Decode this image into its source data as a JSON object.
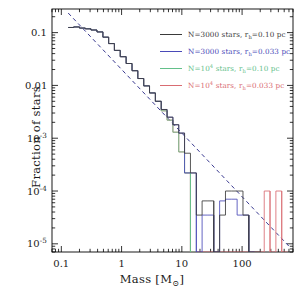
{
  "figure": {
    "background": "#ffffff",
    "frame_color": "#000000"
  },
  "axes": {
    "xlabel_prefix": "Mass [M",
    "xlabel_sub": "⊙",
    "xlabel_suffix": "]",
    "xlabel_full": "Mass [M⊙]",
    "ylabel": "Fraction of stars",
    "x_ticklabels": [
      "0.1",
      "1",
      "10",
      "100"
    ],
    "x_tickvalues": [
      0.1,
      1,
      10,
      100
    ],
    "y_ticklabels": [
      "0.1",
      "0.01",
      "10⁻³",
      "10⁻⁴",
      "10⁻⁵"
    ],
    "y_tickvalues": [
      0.1,
      0.01,
      0.001,
      0.0001,
      1e-05
    ],
    "xscale": "log",
    "yscale": "log",
    "xlim": [
      0.07,
      700
    ],
    "ylim": [
      7e-06,
      0.28
    ],
    "grid": false
  },
  "legend": {
    "position": "upper-right",
    "entries": [
      {
        "label": "N=3000 stars, r",
        "sub": "h",
        "label_tail": "=0.10 pc",
        "full": "N=3000 stars, r_h=0.10 pc",
        "color": "#3a3a3a"
      },
      {
        "label": "N=3000 stars, r",
        "sub": "h",
        "label_tail": "=0.033 pc",
        "full": "N=3000 stars, r_h=0.033 pc",
        "color": "#4a4ab8"
      },
      {
        "label_pre": "N=10",
        "sup": "4",
        "label_mid": " stars, r",
        "sub": "h",
        "label_tail": "=0.10 pc",
        "full": "N=10^4 stars, r_h=0.10 pc",
        "color": "#63c08a"
      },
      {
        "label_pre": "N=10",
        "sup": "4",
        "label_mid": " stars, r",
        "sub": "h",
        "label_tail": "=0.033 pc",
        "full": "N=10^4 stars, r_h=0.033 pc",
        "color": "#d96c72"
      }
    ]
  },
  "chart_data": {
    "type": "line",
    "title": "",
    "xlabel": "Mass [M⊙]",
    "ylabel": "Fraction of stars",
    "xscale": "log",
    "yscale": "log",
    "xlim": [
      0.07,
      700
    ],
    "ylim": [
      7e-06,
      0.28
    ],
    "grid": false,
    "annotations": [
      {
        "name": "salpeter-reference-line",
        "style": "dashed",
        "color": "#2f2f8a",
        "description": "power-law reference line",
        "x": [
          0.13,
          600
        ],
        "y": [
          0.235,
          9e-06
        ]
      }
    ],
    "series": [
      {
        "name": "N=3000 stars, r_h=0.10 pc",
        "color": "#3a3a3a",
        "drawstyle": "steps",
        "x": [
          0.13,
          0.16,
          0.2,
          0.25,
          0.31,
          0.39,
          0.49,
          0.61,
          0.76,
          0.95,
          1.19,
          1.49,
          1.86,
          2.33,
          2.91,
          3.64,
          4.55,
          5.69,
          7.11,
          8.89,
          11.1,
          13.9,
          17.4,
          21.7,
          27.1,
          33.9,
          42.4,
          53.0,
          66.2,
          82.8,
          103.5,
          129.4,
          161.7
        ],
        "y": [
          0.125,
          0.128,
          0.122,
          0.118,
          0.112,
          0.103,
          0.082,
          0.062,
          0.046,
          0.035,
          0.026,
          0.019,
          0.0135,
          0.0098,
          0.0072,
          0.005,
          0.0035,
          0.0025,
          0.0018,
          0.00125,
          0.00052,
          0.00022,
          3.5e-05,
          6.5e-05,
          6.5e-05,
          0.0,
          3.5e-05,
          0.0001,
          0.0001,
          0.0001,
          3.5e-05,
          0.0,
          0.0
        ]
      },
      {
        "name": "N=3000 stars, r_h=0.033 pc",
        "color": "#4a4ab8",
        "drawstyle": "steps",
        "x": [
          0.13,
          0.16,
          0.2,
          0.25,
          0.31,
          0.39,
          0.49,
          0.61,
          0.76,
          0.95,
          1.19,
          1.49,
          1.86,
          2.33,
          2.91,
          3.64,
          4.55,
          5.69,
          7.11,
          8.89,
          11.1,
          13.9,
          17.4,
          21.7,
          27.1,
          33.9,
          42.4,
          53.0,
          66.2,
          82.8,
          103.5,
          129.4
        ],
        "y": [
          0.125,
          0.128,
          0.122,
          0.118,
          0.112,
          0.103,
          0.082,
          0.062,
          0.046,
          0.035,
          0.026,
          0.019,
          0.0135,
          0.0098,
          0.0072,
          0.005,
          0.0035,
          0.0025,
          0.0018,
          0.00125,
          0.00022,
          0.00022,
          0.0,
          3.5e-05,
          3.5e-05,
          0.0,
          6.5e-05,
          7e-05,
          7e-05,
          3.5e-05,
          3.5e-05,
          0.0
        ]
      },
      {
        "name": "N=10^4 stars, r_h=0.10 pc",
        "color": "#63c08a",
        "drawstyle": "steps",
        "x": [
          0.13,
          0.16,
          0.2,
          0.25,
          0.31,
          0.39,
          0.49,
          0.61,
          0.76,
          0.95,
          1.19,
          1.49,
          1.86,
          2.33,
          2.91,
          3.64,
          4.55,
          5.69,
          7.11,
          8.89,
          11.1,
          13.9
        ],
        "y": [
          0.125,
          0.128,
          0.122,
          0.118,
          0.112,
          0.103,
          0.082,
          0.062,
          0.046,
          0.035,
          0.026,
          0.019,
          0.0135,
          0.0098,
          0.0072,
          0.005,
          0.0033,
          0.0022,
          0.0013,
          0.00055,
          0.00022,
          0.0
        ]
      },
      {
        "name": "N=10^4 stars, r_h=0.033 pc",
        "color": "#d96c72",
        "drawstyle": "steps",
        "x": [
          0.13,
          0.16,
          0.2,
          0.25,
          0.31,
          0.39,
          0.49,
          0.61,
          0.76,
          0.95,
          1.19,
          1.49,
          1.86,
          2.33,
          2.91,
          3.64,
          4.55,
          5.69,
          7.11,
          8.89,
          11.1,
          13.9,
          233.0,
          291.0,
          364.0,
          455.0
        ],
        "y": [
          0.125,
          0.128,
          0.122,
          0.118,
          0.112,
          0.103,
          0.082,
          0.062,
          0.046,
          0.035,
          0.026,
          0.019,
          0.0135,
          0.0098,
          0.0072,
          0.005,
          0.0033,
          0.0022,
          0.0013,
          0.00055,
          0.00022,
          0.0,
          0.0001,
          0.0,
          0.0001,
          0.0
        ]
      }
    ]
  }
}
